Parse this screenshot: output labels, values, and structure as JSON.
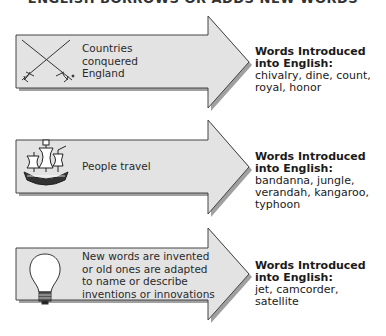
{
  "title": "ENGLISH BORROWS OR ADDS NEW WORDS",
  "arrows": [
    {
      "icon": "crossed-swords-icon",
      "cause": "Countries conquered England",
      "cause_lines": [
        "Countries",
        "conquered",
        "England"
      ],
      "result_heading_lines": [
        "Words Introduced",
        "into English:"
      ],
      "result_words_lines": [
        "chivalry, dine, count,",
        "royal, honor"
      ]
    },
    {
      "icon": "sailing-ship-icon",
      "cause": "People travel",
      "cause_lines": [
        "People travel"
      ],
      "result_heading_lines": [
        "Words Introduced",
        "into English:"
      ],
      "result_words_lines": [
        "bandanna, jungle,",
        "verandah, kangaroo,",
        "typhoon"
      ]
    },
    {
      "icon": "light-bulb-icon",
      "cause": "New words are invented or old ones are adapted to name or describe inventions or innovations",
      "cause_lines": [
        "New words are invented",
        "or old ones are adapted",
        "to name or describe",
        "inventions or innovations"
      ],
      "result_heading_lines": [
        "Words Introduced",
        "into English:"
      ],
      "result_words_lines": [
        "jet, camcorder,",
        "satellite"
      ]
    }
  ],
  "colors": {
    "arrow_fill": "#e3e3e3",
    "arrow_stroke": "#444444",
    "shadow": "#9a9a9a",
    "text": "#1a1a1a"
  }
}
